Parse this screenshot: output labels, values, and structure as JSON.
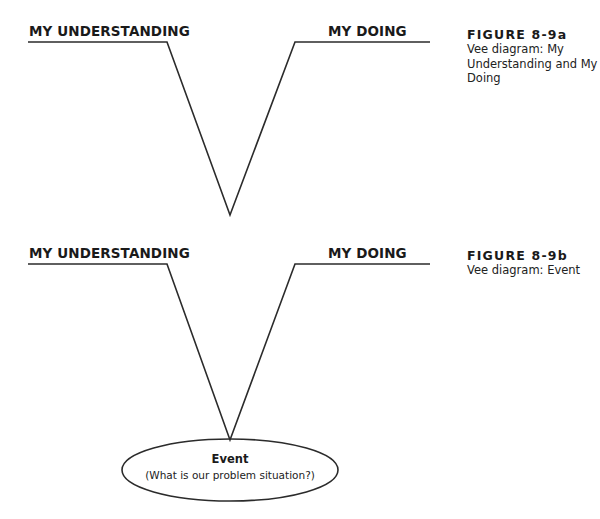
{
  "figures": [
    {
      "id": "8-9a",
      "left_label": "MY UNDERSTANDING",
      "right_label": "MY DOING",
      "caption_title": "FIGURE 8-9a",
      "caption_text": "Vee diagram: My Understanding and My Doing"
    },
    {
      "id": "8-9b",
      "left_label": "MY UNDERSTANDING",
      "right_label": "MY DOING",
      "caption_title": "FIGURE 8-9b",
      "caption_text": "Vee diagram: Event",
      "event": {
        "title": "Event",
        "subtitle": "(What is our problem situation?)"
      }
    }
  ],
  "colors": {
    "line": "#2b2b2b",
    "text": "#1a1a1a"
  }
}
